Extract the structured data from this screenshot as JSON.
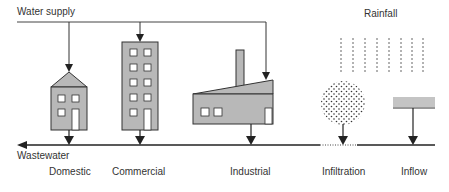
{
  "labels": {
    "water_supply": "Water supply",
    "rainfall": "Rainfall",
    "wastewater": "Wastewater",
    "domestic": "Domestic",
    "commercial": "Commercial",
    "industrial": "Industrial",
    "infiltration": "Infiltration",
    "inflow": "Inflow"
  },
  "colors": {
    "line": "#222222",
    "building_fill": "#b8b8b8",
    "window_fill": "#ffffff",
    "text": "#333333",
    "inflow_fill": "#c4c4c4"
  }
}
